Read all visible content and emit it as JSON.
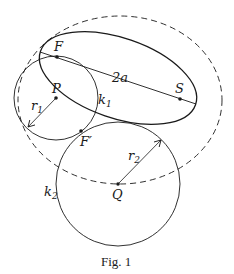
{
  "figure": {
    "caption": "Fig. 1",
    "colors": {
      "stroke": "#1a1a1a",
      "background": "#ffffff"
    },
    "points": {
      "F": {
        "label": "F",
        "x": 57,
        "y": 57
      },
      "S": {
        "label": "S",
        "x": 180,
        "y": 99
      },
      "P": {
        "label": "P",
        "x": 56,
        "y": 98
      },
      "F_prime": {
        "label": "F′",
        "x": 81,
        "y": 131
      },
      "Q": {
        "label": "Q",
        "x": 118,
        "y": 184
      }
    },
    "labels": {
      "major_axis": "2a",
      "r1": "r",
      "r1_sub": "1",
      "r2": "r",
      "r2_sub": "2",
      "k1": "k",
      "k1_sub": "1",
      "k2": "k",
      "k2_sub": "2"
    },
    "shapes": {
      "ellipse_solid": {
        "cx": 118,
        "cy": 78,
        "rx": 82,
        "ry": 40,
        "rotate": 19
      },
      "ellipse_dashed": {
        "cx": 120,
        "cy": 100,
        "rx": 102,
        "ry": 84,
        "rotate": 0
      },
      "circle_k1": {
        "cx": 56,
        "cy": 98,
        "r": 42
      },
      "circle_k2": {
        "cx": 118,
        "cy": 184,
        "r": 62
      }
    }
  }
}
